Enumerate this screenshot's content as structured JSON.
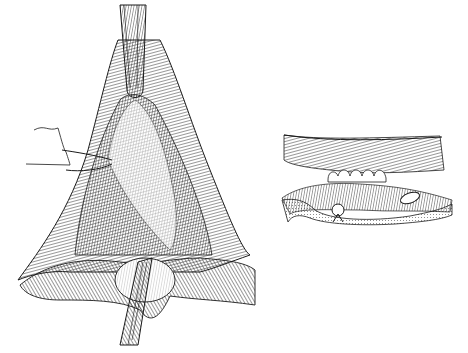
{
  "figure": {
    "style": "black-and-white surgical line engraving",
    "background": "#ffffff",
    "ink": "#1a1a1a",
    "panels": [
      {
        "id": "main",
        "subject": "retracted operative field with retractor above, stay suture at left, forceps below"
      },
      {
        "id": "inset",
        "subject": "cross-section detail showing tissue layers with interrupted sutures"
      }
    ]
  }
}
